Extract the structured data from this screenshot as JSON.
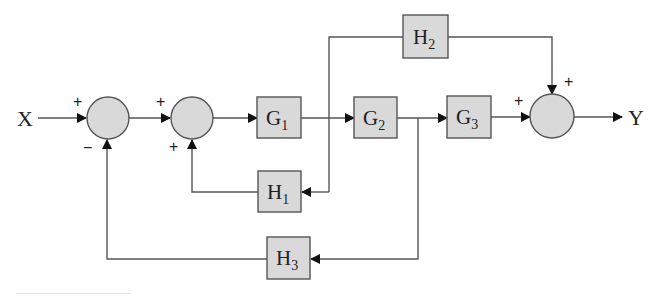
{
  "diagram": {
    "type": "block-diagram",
    "input_label": "X",
    "output_label": "Y",
    "colors": {
      "block_fill": "#d9d9d9",
      "stroke": "#555555",
      "text": "#222222"
    },
    "blocks": [
      {
        "id": "G1",
        "base": "G",
        "sub": "1"
      },
      {
        "id": "G2",
        "base": "G",
        "sub": "2"
      },
      {
        "id": "G3",
        "base": "G",
        "sub": "3"
      },
      {
        "id": "H1",
        "base": "H",
        "sub": "1"
      },
      {
        "id": "H2",
        "base": "H",
        "sub": "2"
      },
      {
        "id": "H3",
        "base": "H",
        "sub": "3"
      }
    ],
    "junctions": [
      {
        "id": "S1",
        "signs": {
          "input": "+",
          "feedback": "−"
        }
      },
      {
        "id": "S2",
        "signs": {
          "input": "+",
          "feedback": "+"
        }
      },
      {
        "id": "S3",
        "signs": {
          "input": "+",
          "feedforward": "+"
        }
      }
    ],
    "connections": [
      "X → S1(+)",
      "S1 → S2(+)",
      "S2 → G1",
      "G1 → G2",
      "G2 → G3",
      "G3 → S3(+)",
      "S3 → Y",
      "G1 output → H2 → S3(+)",
      "G1 output → H1 → S2(+)",
      "G2 output → H3 → S1(−)"
    ]
  }
}
